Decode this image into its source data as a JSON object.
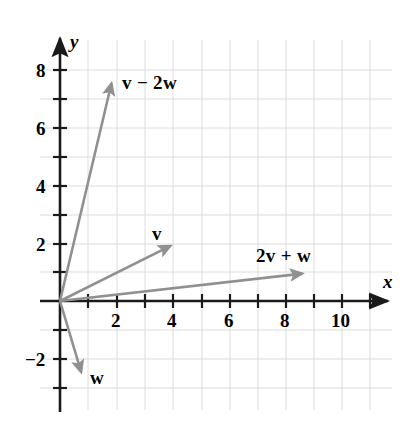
{
  "figure": {
    "background_color": "#ffffff",
    "axis_color": "#1a1a1a",
    "grid_color": "#dcdce0",
    "vector_color": "#909090",
    "label_color": "#000000"
  },
  "axes": {
    "x_name": "x",
    "y_name": "y",
    "x_tick_labels": [
      "2",
      "4",
      "6",
      "8",
      "10"
    ],
    "x_tick_values": [
      2,
      4,
      6,
      8,
      10
    ],
    "y_tick_labels": [
      "8",
      "6",
      "4",
      "2",
      "−2"
    ],
    "y_tick_values": [
      8,
      6,
      4,
      2,
      -2
    ],
    "x_range": [
      -1,
      11.8
    ],
    "y_range": [
      -3.2,
      8.8
    ],
    "grid": true,
    "minor_ticks": true
  },
  "chart_data": {
    "type": "scatter",
    "title": "",
    "xlabel": "x",
    "ylabel": "y",
    "xlim": [
      -1,
      11.8
    ],
    "ylim": [
      -3.2,
      8.8
    ],
    "grid": true,
    "legend": "none",
    "vectors": [
      {
        "name": "v-minus-2w",
        "label": "v − 2w",
        "label_parts": [
          {
            "text": "v",
            "style": "bold-italic-vector"
          },
          {
            "text": " − ",
            "style": "operator"
          },
          {
            "text": "2",
            "style": "number"
          },
          {
            "text": "w",
            "style": "bold-italic-vector"
          }
        ],
        "start": [
          0,
          0
        ],
        "end": [
          1.87,
          7.72
        ],
        "label_x": 2.2,
        "label_y": 7.5
      },
      {
        "name": "v",
        "label": "v",
        "label_parts": [
          {
            "text": "v",
            "style": "bold-italic-vector"
          }
        ],
        "start": [
          0,
          0
        ],
        "end": [
          4.1,
          2.0
        ],
        "label_x": 3.4,
        "label_y": 2.65
      },
      {
        "name": "2v-plus-w",
        "label": "2v + w",
        "label_parts": [
          {
            "text": "2",
            "style": "number"
          },
          {
            "text": "v",
            "style": "bold-italic-vector"
          },
          {
            "text": " + ",
            "style": "operator"
          },
          {
            "text": "w",
            "style": "bold-italic-vector"
          }
        ],
        "start": [
          0,
          0
        ],
        "end": [
          8.78,
          0.97
        ],
        "label_x": 6.95,
        "label_y": 1.78
      },
      {
        "name": "w",
        "label": "w",
        "label_parts": [
          {
            "text": "w",
            "style": "bold-italic-vector"
          }
        ],
        "start": [
          0,
          0
        ],
        "end": [
          0.81,
          -2.66
        ],
        "label_x": 1.17,
        "label_y": -2.52
      }
    ]
  },
  "labels": {
    "x_axis": "x",
    "y_axis": "y",
    "tick_x_2": "2",
    "tick_x_4": "4",
    "tick_x_6": "6",
    "tick_x_8": "8",
    "tick_x_10": "10",
    "tick_y_8": "8",
    "tick_y_6": "6",
    "tick_y_4": "4",
    "tick_y_2": "2",
    "tick_y_neg2": "−2",
    "vec_v_minus_2w_v": "v",
    "vec_v_minus_2w_op": "−",
    "vec_v_minus_2w_num": "2",
    "vec_v_minus_2w_w": "w",
    "vec_v": "v",
    "vec_2v_plus_w_num": "2",
    "vec_2v_plus_w_v": "v",
    "vec_2v_plus_w_op": "+",
    "vec_2v_plus_w_w": "w",
    "vec_w": "w"
  }
}
